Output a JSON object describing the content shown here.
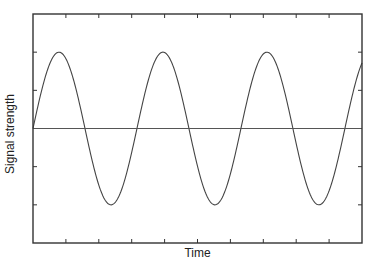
{
  "chart_data": {
    "type": "line",
    "title": "",
    "xlabel": "Time",
    "ylabel": "Signal strength",
    "x_tick_labels": [],
    "y_tick_labels": [],
    "grid": false,
    "legend": null,
    "xlim": [
      0,
      10
    ],
    "ylim": [
      -3,
      3
    ],
    "x_ticks": [
      1,
      2,
      3,
      4,
      5,
      6,
      7,
      8,
      9
    ],
    "y_ticks": [
      -2,
      -1,
      0,
      1,
      2
    ],
    "series": [
      {
        "name": "signal",
        "kind": "sine",
        "amplitude": 2,
        "offset": 0,
        "period": 3.16,
        "phase": 0,
        "cycles_shown": 3.16,
        "peaks_x": [
          0.79,
          3.95,
          7.07
        ],
        "troughs_x": [
          2.4,
          5.5,
          8.6
        ],
        "peak_y": 2,
        "trough_y": -2
      },
      {
        "name": "baseline",
        "kind": "constant",
        "value": 0
      }
    ]
  },
  "colors": {
    "axis": "#333333",
    "signal": "#444444",
    "baseline": "#555555",
    "text": "#222222",
    "background": "#ffffff"
  },
  "layout": {
    "plot_left": 33,
    "plot_right": 362,
    "plot_top": 14,
    "plot_bottom": 243
  }
}
